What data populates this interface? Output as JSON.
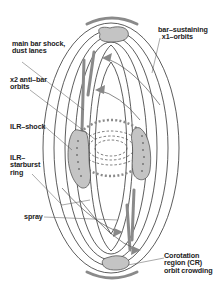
{
  "labels": {
    "main_bar_shock": "main bar shock,\ndust lanes",
    "x2_orbits": "x2 anti–bar\norbits",
    "ilr_shock": "ILR–shock",
    "ilr_starburst": "ILR–\nstarburst\nring",
    "spray": "spray",
    "x1_orbits": "bar–sustaining\n  x1–orbits",
    "corotation": "Corotation\nregion (CR)\norbit crowding"
  },
  "colors": {
    "line": "#333333",
    "blob_fill": "#c4c4c4",
    "band": "#8a8a8a"
  }
}
